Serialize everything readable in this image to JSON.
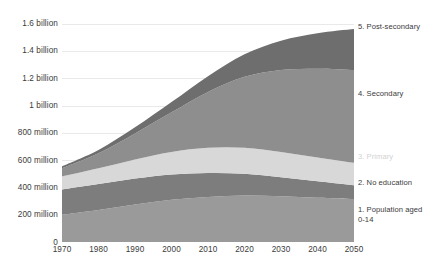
{
  "chart_data": {
    "type": "area",
    "stacked": true,
    "title": "",
    "subtitle": "",
    "xlabel": "",
    "ylabel": "",
    "x": [
      1970,
      1980,
      1990,
      2000,
      2010,
      2020,
      2030,
      2040,
      2050
    ],
    "xlim": [
      1970,
      2050
    ],
    "ylim": [
      0,
      1700000000
    ],
    "grid": true,
    "legend_position": "right-inline",
    "x_tick_labels": [
      "1970",
      "1980",
      "1990",
      "2000",
      "2010",
      "2020",
      "2030",
      "2040",
      "2050"
    ],
    "y_tick_labels": [
      "0",
      "200 million",
      "400 million",
      "600 million",
      "800 million",
      "1 billion",
      "1.2 billion",
      "1.4 billion",
      "1.6 billion"
    ],
    "y_tick_values": [
      0,
      200000000,
      400000000,
      600000000,
      800000000,
      1000000000,
      1200000000,
      1400000000,
      1600000000
    ],
    "series": [
      {
        "name": "1. Population aged 0-14",
        "label": "1. Population aged\n0-14",
        "color": "#9a9a9a",
        "label_color": "#3b3b3b",
        "label_y": 205,
        "values": [
          200000000,
          235000000,
          275000000,
          310000000,
          330000000,
          340000000,
          335000000,
          325000000,
          315000000
        ]
      },
      {
        "name": "2. No education",
        "label": "2. No education",
        "color": "#7d7d7d",
        "label_color": "#3b3b3b",
        "label_y": 178,
        "values": [
          185000000,
          190000000,
          190000000,
          185000000,
          175000000,
          160000000,
          140000000,
          120000000,
          100000000
        ]
      },
      {
        "name": "3. Primary",
        "label": "3. Primary",
        "color": "#d8d8d8",
        "label_color": "#d2d2d2",
        "label_y": 152,
        "values": [
          95000000,
          115000000,
          140000000,
          165000000,
          185000000,
          190000000,
          185000000,
          175000000,
          165000000
        ]
      },
      {
        "name": "4. Secondary",
        "label": "4. Secondary",
        "color": "#8e8e8e",
        "label_color": "#3b3b3b",
        "label_y": 89,
        "values": [
          60000000,
          110000000,
          190000000,
          290000000,
          410000000,
          520000000,
          600000000,
          650000000,
          680000000
        ]
      },
      {
        "name": "5. Post-secondary",
        "label": "5. Post-secondary",
        "color": "#6e6e6e",
        "label_color": "#3b3b3b",
        "label_y": 22,
        "values": [
          15000000,
          25000000,
          45000000,
          75000000,
          115000000,
          165000000,
          215000000,
          260000000,
          300000000
        ]
      }
    ]
  }
}
